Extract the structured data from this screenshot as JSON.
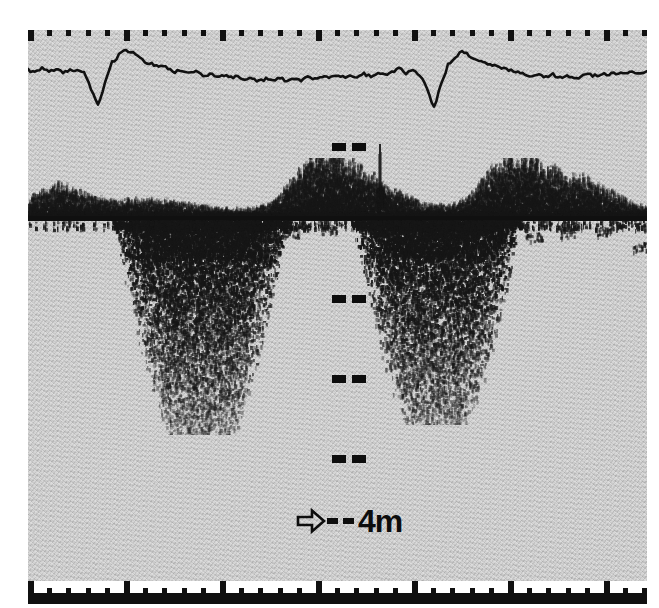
{
  "figure": {
    "kind": "echosounder-paper-echogram",
    "background_color": "#c9c9c9",
    "ink_color": "#101010",
    "page_color": "#ffffff"
  },
  "scale_annotation": {
    "arrow_icon": "right-arrow-outline-icon",
    "dash_count": 2,
    "label": "4m"
  },
  "depth_marks": {
    "dash_pair_count": 2,
    "positions_y": [
      143,
      295,
      375,
      455
    ],
    "x": 332
  },
  "top_ruler": {
    "tick_count": 33,
    "major_every": 5,
    "spacing_px": 19.2
  },
  "bottom_ruler": {
    "tick_count": 33,
    "major_every": 5,
    "spacing_px": 19.2,
    "has_solid_bar": true
  },
  "surface_line": {
    "label": "surface-echo-line",
    "y": 186
  },
  "chart_data": {
    "type": "line",
    "title": "",
    "subtitle": "",
    "xlabel": "",
    "ylabel": "",
    "legend": [],
    "grid": false,
    "series": [
      {
        "name": "echo-integrator-trace",
        "x": [
          0,
          7,
          14,
          21,
          28,
          35,
          42,
          49,
          56,
          63,
          70,
          77,
          84,
          91,
          98,
          105,
          112,
          119,
          126,
          133,
          140,
          147,
          154,
          161,
          168,
          175,
          182,
          189,
          196,
          203,
          210,
          217,
          224,
          231,
          238,
          245,
          252,
          259,
          266,
          273,
          280,
          287,
          294,
          301,
          308,
          315,
          322,
          329,
          336,
          343,
          350,
          357,
          364,
          371,
          378,
          385,
          392,
          399,
          406,
          413,
          420,
          427,
          434,
          441,
          448,
          455,
          462,
          469,
          476,
          483,
          490,
          497,
          504,
          511,
          518,
          525,
          532,
          539,
          546,
          553,
          560,
          567,
          574,
          581,
          588,
          595,
          602,
          609,
          619
        ],
        "values": [
          50,
          47,
          53,
          48,
          52,
          46,
          51,
          49,
          47,
          30,
          12,
          36,
          58,
          66,
          72,
          68,
          63,
          58,
          56,
          54,
          52,
          48,
          50,
          46,
          48,
          44,
          46,
          43,
          45,
          42,
          44,
          40,
          42,
          38,
          41,
          39,
          42,
          38,
          41,
          39,
          42,
          40,
          43,
          41,
          44,
          42,
          45,
          43,
          46,
          44,
          47,
          45,
          48,
          52,
          46,
          50,
          44,
          30,
          10,
          34,
          56,
          64,
          70,
          66,
          62,
          58,
          56,
          54,
          52,
          50,
          48,
          46,
          44,
          46,
          43,
          45,
          42,
          44,
          41,
          43,
          45,
          44,
          46,
          45,
          47,
          46,
          48,
          47,
          49
        ],
        "ylim": [
          0,
          80
        ],
        "xlim": [
          0,
          619
        ]
      }
    ],
    "scattering_layer": {
      "name": "pelagic-scattering-layer",
      "band_top_y": 150,
      "band_bottom_y": 186,
      "peaks_x": [
        30,
        120,
        290,
        330,
        480,
        540
      ],
      "peak_heights": [
        22,
        10,
        34,
        28,
        40,
        30
      ]
    },
    "schools": [
      {
        "name": "fish-school-left",
        "x": 95,
        "width": 150,
        "top_y": 192,
        "depth_px": 205
      },
      {
        "name": "fish-school-right",
        "x": 330,
        "width": 130,
        "top_y": 192,
        "depth_px": 195
      }
    ],
    "artifact": {
      "name": "vertical-spike-artifact",
      "x": 350,
      "top_y": 148,
      "height": 72
    }
  }
}
